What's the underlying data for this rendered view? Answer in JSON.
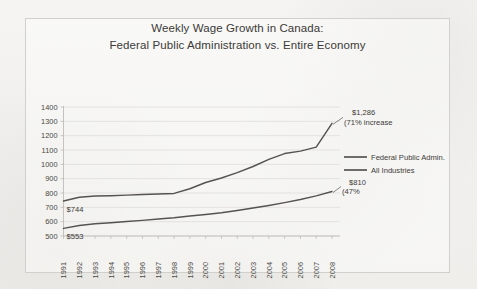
{
  "chart_data": {
    "type": "line",
    "title_line1": "Weekly Wage Growth in Canada:",
    "title_line2": "Federal Public Administration vs.  Entire Economy",
    "xlabel": "",
    "ylabel": "",
    "ylim": [
      500,
      1400
    ],
    "ytick_step": 100,
    "grid": true,
    "legend_position": "right",
    "categories": [
      "1991",
      "1992",
      "1993",
      "1994",
      "1995",
      "1996",
      "1997",
      "1998",
      "1999",
      "2000",
      "2001",
      "2002",
      "2003",
      "2004",
      "2005",
      "2006",
      "2007",
      "2008"
    ],
    "yticks": [
      "1400",
      "1300",
      "1200",
      "1100",
      "1000",
      "900",
      "800",
      "700",
      "600",
      "500"
    ],
    "series": [
      {
        "name": "Federal Public Admin.",
        "values": [
          744,
          770,
          779,
          781,
          785,
          789,
          793,
          797,
          830,
          873,
          905,
          942,
          985,
          1035,
          1075,
          1092,
          1120,
          1286
        ]
      },
      {
        "name": "All Industries",
        "values": [
          553,
          573,
          585,
          592,
          601,
          609,
          618,
          627,
          640,
          650,
          662,
          678,
          695,
          713,
          733,
          755,
          780,
          810
        ]
      }
    ],
    "annotations": [
      {
        "id": "start-federal",
        "text": "$744"
      },
      {
        "id": "start-industries",
        "text": "$553"
      },
      {
        "id": "end-federal-value",
        "text": "$1,286"
      },
      {
        "id": "end-federal-pct",
        "text": "(71% increase"
      },
      {
        "id": "end-industries-value",
        "text": "$810"
      },
      {
        "id": "end-industries-pct",
        "text": "(47%"
      }
    ],
    "colors": {
      "line": "#555350",
      "grid": "#dcdad7",
      "axis": "#b8b6b3",
      "text": "#3d3b39",
      "background": "#f3f2f0"
    }
  }
}
